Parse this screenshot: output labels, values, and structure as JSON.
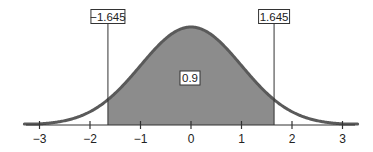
{
  "chart_data": {
    "type": "area",
    "title": "",
    "subtitle": "",
    "xlabel": "",
    "ylabel": "",
    "distribution": "standard normal",
    "mean": 0,
    "sd": 1,
    "xlim": [
      -3.3,
      3.3
    ],
    "x_ticks": [
      -3,
      -2,
      -1,
      0,
      1,
      2,
      3
    ],
    "x_tick_labels": [
      "−3",
      "−2",
      "−1",
      "0",
      "1",
      "2",
      "3"
    ],
    "grid": false,
    "legend": null,
    "shaded_region": {
      "from": -1.645,
      "to": 1.645,
      "area": 0.9
    },
    "annotations": [
      {
        "text": "−1.645",
        "x": -1.645,
        "kind": "critical-value-left"
      },
      {
        "text": "1.645",
        "x": 1.645,
        "kind": "critical-value-right"
      },
      {
        "text": "0.9",
        "x": 0,
        "kind": "shaded-area-label"
      }
    ]
  },
  "labels": {
    "left_critical": "−1.645",
    "right_critical": "1.645",
    "area": "0.9"
  },
  "colors": {
    "curve": "#5a5a5a",
    "fill": "#8c8c8c",
    "axis": "#333333",
    "label_border": "#333333",
    "text": "#222222"
  }
}
